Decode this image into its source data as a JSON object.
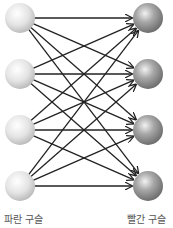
{
  "diagram": {
    "type": "bipartite-complete-graph",
    "left_group": {
      "label": "파란 구슬",
      "node_count": 4,
      "color": "#e6e6e6"
    },
    "right_group": {
      "label": "빨간 구슬",
      "node_count": 4,
      "color": "#8a8a8a"
    },
    "edges": "every left node connects to every right node with an arrow",
    "edge_color": "#222222"
  }
}
